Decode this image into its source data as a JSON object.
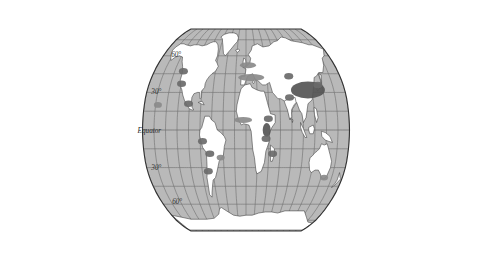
{
  "figure": {
    "type": "thematic-world-map",
    "projection": "Robinson",
    "background_color": "#ffffff",
    "ocean_color": "#b9b9b9",
    "land_color": "#ffffff",
    "graticule_color": "#6e6e6e",
    "outline_color": "#333333",
    "density_light_color": "#a6a6a6",
    "density_mid_color": "#8a8a8a",
    "density_dark_color": "#6a6a6a",
    "density_darkest_color": "#555555"
  },
  "labels": {
    "north_60": "60°",
    "north_30": "30°",
    "equator": "Equator",
    "south_30": "30°",
    "south_60": "60°",
    "edge_artifact": "e"
  },
  "graticule": {
    "parallels": [
      75,
      60,
      45,
      30,
      15,
      0,
      -15,
      -30,
      -45,
      -60,
      -75
    ],
    "meridians": [
      -180,
      -160,
      -140,
      -120,
      -100,
      -80,
      -60,
      -40,
      -20,
      0,
      20,
      40,
      60,
      80,
      100,
      120,
      140,
      160,
      180
    ],
    "labeled_parallels": [
      60,
      30,
      0,
      -30,
      -60
    ]
  },
  "chart_data": {
    "type": "heatmap",
    "title": "",
    "xlabel": "",
    "ylabel": "",
    "regions": [
      {
        "name": "Eastern China",
        "intensity": "darkest",
        "lon": 113,
        "lat": 32
      },
      {
        "name": "Korea-Japan",
        "intensity": "dark",
        "lon": 133,
        "lat": 36
      },
      {
        "name": "Central Asia spots",
        "intensity": "dark",
        "lon": 82,
        "lat": 43
      },
      {
        "name": "Northern India",
        "intensity": "dark",
        "lon": 78,
        "lat": 26
      },
      {
        "name": "East Africa Rift",
        "intensity": "darkest",
        "lon": 36,
        "lat": 0
      },
      {
        "name": "Ethiopia",
        "intensity": "dark",
        "lon": 39,
        "lat": 9
      },
      {
        "name": "Tanzania",
        "intensity": "dark",
        "lon": 35,
        "lat": -7
      },
      {
        "name": "Madagascar",
        "intensity": "dark",
        "lon": 47,
        "lat": -19
      },
      {
        "name": "West Africa",
        "intensity": "mid",
        "lon": -5,
        "lat": 8
      },
      {
        "name": "Mediterranean Europe",
        "intensity": "mid",
        "lon": 10,
        "lat": 42
      },
      {
        "name": "Northwest Europe",
        "intensity": "mid",
        "lon": 4,
        "lat": 52
      },
      {
        "name": "Pacific Northwest USA",
        "intensity": "dark",
        "lon": -123,
        "lat": 47
      },
      {
        "name": "California",
        "intensity": "dark",
        "lon": -120,
        "lat": 37
      },
      {
        "name": "Mexico",
        "intensity": "dark",
        "lon": -102,
        "lat": 21
      },
      {
        "name": "Hawaii",
        "intensity": "mid",
        "lon": -156,
        "lat": 20
      },
      {
        "name": "Peru-Ecuador Andes",
        "intensity": "dark",
        "lon": -76,
        "lat": -9
      },
      {
        "name": "Bolivia",
        "intensity": "dark",
        "lon": -64,
        "lat": -19
      },
      {
        "name": "Argentina-Chile",
        "intensity": "dark",
        "lon": -69,
        "lat": -33
      },
      {
        "name": "Southeast Brazil",
        "intensity": "mid",
        "lon": -45,
        "lat": -22
      },
      {
        "name": "Southeast Australia",
        "intensity": "mid",
        "lon": 146,
        "lat": -38
      }
    ]
  }
}
